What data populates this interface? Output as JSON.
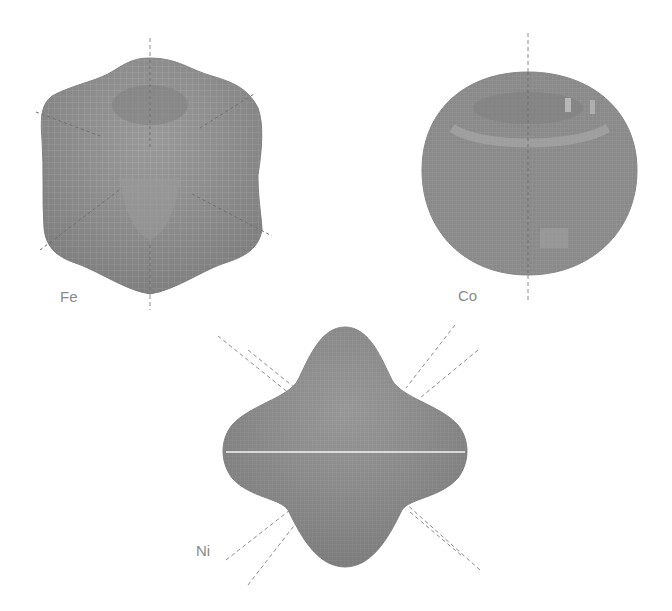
{
  "figure": {
    "panels": [
      {
        "id": "fe",
        "label": "Fe",
        "shape": "rounded cube-like anisotropy surface with dimpled top"
      },
      {
        "id": "co",
        "label": "Co",
        "shape": "near-spherical oblate surface with ring ridge"
      },
      {
        "id": "ni",
        "label": "Ni",
        "shape": "four-lobed octahedral anisotropy surface"
      }
    ],
    "colors": {
      "surface": "#8f8f8f",
      "surface_dark": "#7c7c7c",
      "mesh": "#a9a9a9",
      "axis": "#8c8c8c",
      "label": "#8a8a8a"
    }
  }
}
